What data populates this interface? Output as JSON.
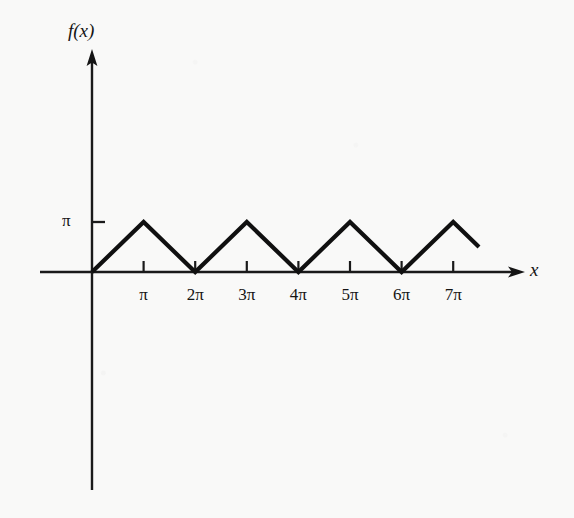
{
  "figure": {
    "axis_labels": {
      "y": "f(x)",
      "x": "x"
    },
    "y_tick_label": "π",
    "x_tick_labels": [
      "π",
      "2π",
      "3π",
      "4π",
      "5π",
      "6π",
      "7π"
    ],
    "colors": {
      "curve": "#101010",
      "axis": "#1a1a1a",
      "background": "#f9f9f8"
    }
  },
  "chart_data": {
    "type": "line",
    "title": "",
    "xlabel": "x",
    "ylabel": "f(x)",
    "x_tick_values": [
      3.1416,
      6.2832,
      9.4248,
      12.5664,
      15.708,
      18.8496,
      21.9911
    ],
    "x_tick_labels": [
      "π",
      "2π",
      "3π",
      "4π",
      "5π",
      "6π",
      "7π"
    ],
    "y_tick_values": [
      3.1416
    ],
    "y_tick_labels": [
      "π"
    ],
    "xlim": [
      0,
      24.2
    ],
    "ylim": [
      0,
      4.2
    ],
    "grid": false,
    "legend": null,
    "x": [
      0,
      3.1416,
      6.2832,
      9.4248,
      12.5664,
      15.708,
      18.8496,
      21.9911,
      23.56
    ],
    "values": [
      0,
      3.1416,
      0,
      3.1416,
      0,
      3.1416,
      0,
      3.1416,
      1.57
    ],
    "series": [
      {
        "name": "f(x)",
        "x": [
          0,
          3.1416,
          6.2832,
          9.4248,
          12.5664,
          15.708,
          18.8496,
          21.9911,
          23.56
        ],
        "values": [
          0,
          3.1416,
          0,
          3.1416,
          0,
          3.1416,
          0,
          3.1416,
          1.57
        ]
      }
    ]
  }
}
